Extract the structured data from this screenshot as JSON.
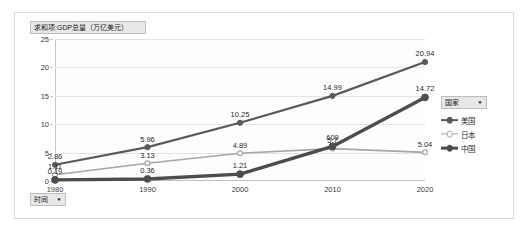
{
  "chart_object": {
    "value_field_button": {
      "label": "求和项:GDP总量（万亿美元）",
      "arrow": ""
    },
    "axis_field_button": {
      "label": "时间",
      "arrow": "▼"
    },
    "legend_field_button": {
      "label": "国家",
      "arrow": "▼"
    }
  },
  "legend": {
    "position": "right",
    "entries": [
      {
        "name": "美国",
        "color": "#5a5a5a"
      },
      {
        "name": "日本",
        "color": "#a6a6a6"
      },
      {
        "name": "中国",
        "color": "#4d4d4d"
      }
    ]
  },
  "chart_data": {
    "type": "line",
    "title": "求和项:GDP总量（万亿美元）",
    "xlabel": "时间",
    "ylabel": "",
    "categories": [
      "1980",
      "1990",
      "2000",
      "2010",
      "2020"
    ],
    "ylim": [
      0,
      25
    ],
    "yticks": [
      "0",
      "5",
      "10",
      "15",
      "20",
      "25"
    ],
    "grid": true,
    "legend_position": "right",
    "series": [
      {
        "name": "美国",
        "color": "#5a5a5a",
        "values": [
          2.86,
          5.96,
          10.25,
          14.99,
          20.94
        ],
        "labels": [
          "2.86",
          "5.96",
          "10.25",
          "14.99",
          "20.94"
        ]
      },
      {
        "name": "日本",
        "color": "#a6a6a6",
        "values": [
          1.11,
          3.13,
          4.89,
          5.7,
          5.04
        ],
        "labels": [
          "1.11",
          "3.13",
          "4.89",
          "5.7",
          "5.04"
        ]
      },
      {
        "name": "中国",
        "color": "#4d4d4d",
        "values": [
          0.19,
          0.36,
          1.21,
          6.09,
          14.72
        ],
        "labels": [
          "0.19",
          "0.36",
          "1.21",
          "609",
          "14.72"
        ]
      }
    ]
  }
}
